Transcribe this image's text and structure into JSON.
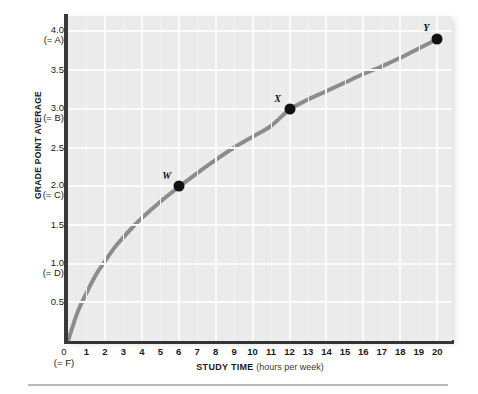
{
  "chart_data": {
    "type": "line",
    "title": "",
    "xlabel": "STUDY TIME (hours per week)",
    "xlabel_strong": "STUDY TIME",
    "xlabel_weak": " (hours per week)",
    "ylabel": "GRADE POINT AVERAGE",
    "xlim": [
      0,
      20.8
    ],
    "ylim": [
      0,
      4.2
    ],
    "grid": true,
    "legend": "none",
    "x_ticks": [
      {
        "value": 1,
        "label": "1"
      },
      {
        "value": 2,
        "label": "2"
      },
      {
        "value": 3,
        "label": "3"
      },
      {
        "value": 4,
        "label": "4"
      },
      {
        "value": 5,
        "label": "5"
      },
      {
        "value": 6,
        "label": "6"
      },
      {
        "value": 7,
        "label": "7"
      },
      {
        "value": 8,
        "label": "8"
      },
      {
        "value": 9,
        "label": "9"
      },
      {
        "value": 10,
        "label": "10"
      },
      {
        "value": 11,
        "label": "11"
      },
      {
        "value": 12,
        "label": "12"
      },
      {
        "value": 13,
        "label": "13"
      },
      {
        "value": 14,
        "label": "14"
      },
      {
        "value": 15,
        "label": "15"
      },
      {
        "value": 16,
        "label": "16"
      },
      {
        "value": 17,
        "label": "17"
      },
      {
        "value": 18,
        "label": "18"
      },
      {
        "value": 19,
        "label": "19"
      },
      {
        "value": 20,
        "label": "20"
      }
    ],
    "origin_tick": {
      "value": 0,
      "label": "0",
      "grade": "(= F)"
    },
    "y_ticks": [
      {
        "value": 4.0,
        "label": "4.0",
        "grade": "(= A)"
      },
      {
        "value": 3.5,
        "label": "3.5",
        "grade": ""
      },
      {
        "value": 3.0,
        "label": "3.0",
        "grade": "(= B)"
      },
      {
        "value": 2.5,
        "label": "2.5",
        "grade": ""
      },
      {
        "value": 2.0,
        "label": "2.0",
        "grade": "(= C)"
      },
      {
        "value": 1.5,
        "label": "1.5",
        "grade": ""
      },
      {
        "value": 1.0,
        "label": "1.0",
        "grade": "(= D)"
      },
      {
        "value": 0.5,
        "label": "0.5",
        "grade": ""
      }
    ],
    "series": [
      {
        "name": "GPA vs study time",
        "color": "#8c8c8c",
        "line_width": 4,
        "x": [
          0,
          0.5,
          1,
          1.5,
          2,
          2.5,
          3,
          3.5,
          4,
          5,
          6,
          7,
          8,
          9,
          10,
          11,
          12,
          13,
          14,
          15,
          16,
          17,
          18,
          19,
          20
        ],
        "values": [
          0,
          0.36,
          0.62,
          0.85,
          1.03,
          1.2,
          1.34,
          1.47,
          1.59,
          1.8,
          1.99,
          2.17,
          2.34,
          2.5,
          2.64,
          2.78,
          2.99,
          3.12,
          3.23,
          3.34,
          3.45,
          3.55,
          3.66,
          3.78,
          3.9
        ]
      }
    ],
    "points": [
      {
        "label": "W",
        "x": 6,
        "y": 2.0,
        "label_dx": -12,
        "label_dy": -11
      },
      {
        "label": "X",
        "x": 12,
        "y": 3.0,
        "label_dx": -12,
        "label_dy": -11
      },
      {
        "label": "Y",
        "x": 20,
        "y": 3.9,
        "label_dx": -11,
        "label_dy": -12
      }
    ],
    "grid_x_lines": [
      2,
      4,
      6,
      8,
      10,
      12,
      14,
      16,
      18,
      20
    ],
    "grid_y_lines": [
      0.5,
      1.0,
      1.5,
      2.0,
      2.5,
      3.0,
      3.5,
      4.0
    ],
    "colors": {
      "plot_background": "#ebebeb",
      "grid_line": "#fbfbfb",
      "axis_line": "#3a3a3a",
      "curve": "#8c8c8c",
      "marker": "#111111",
      "text": "#1b1b1b",
      "rule": "#b9b9b9"
    }
  }
}
